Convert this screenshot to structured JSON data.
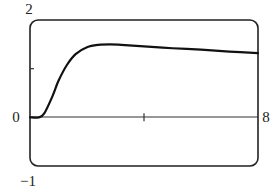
{
  "chart_data": {
    "type": "line",
    "title": "",
    "xlabel": "",
    "ylabel": "",
    "xlim": [
      0,
      8
    ],
    "ylim": [
      -1,
      2
    ],
    "x_tick_labels": [
      "0",
      "8"
    ],
    "y_tick_labels": [
      "2",
      "-1"
    ],
    "x_ticks": [
      4
    ],
    "y_ticks": [
      1
    ],
    "grid": false,
    "legend": null,
    "frame": "rounded-rectangle viewing window",
    "series": [
      {
        "name": "curve",
        "color": "#111111",
        "x": [
          0,
          0.3,
          0.5,
          0.8,
          1.0,
          1.3,
          1.6,
          2.0,
          2.4,
          2.8,
          3.2,
          4.0,
          5.0,
          6.0,
          7.0,
          8.0
        ],
        "y": [
          0,
          0,
          0.08,
          0.45,
          0.75,
          1.08,
          1.3,
          1.44,
          1.49,
          1.5,
          1.49,
          1.46,
          1.42,
          1.39,
          1.35,
          1.32
        ]
      }
    ]
  },
  "labels": {
    "y_top": "2",
    "y_bottom": "−1",
    "x_left": "0",
    "x_right": "8"
  }
}
